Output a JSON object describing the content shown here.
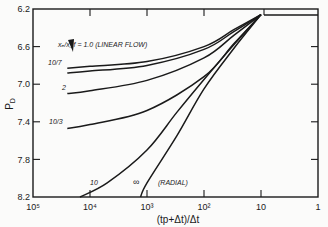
{
  "chart_data": {
    "type": "line",
    "title": "",
    "xlabel": "(tp+Δt)/Δt",
    "ylabel": "PD",
    "x_scale": "log",
    "x_reversed": true,
    "xlim": [
      100000,
      1
    ],
    "ylim": [
      8.2,
      6.2
    ],
    "y_reversed": true,
    "x_ticks": [
      "10^5",
      "10^4",
      "10^3",
      "10^2",
      "10",
      "1"
    ],
    "x_tick_labels": [
      "10⁵",
      "10⁴",
      "10³",
      "10²",
      "10",
      "1"
    ],
    "y_ticks": [
      "6.2",
      "6.6",
      "7.0",
      "7.4",
      "7.8",
      "8.2"
    ],
    "grid": false,
    "legend": "none (curves labeled inline)",
    "series": [
      {
        "name": "xe/xf = 1.0 (LINEAR FLOW)",
        "label": "xe/xf = 1.0 (LINEAR FLOW)",
        "x": [
          25000,
          10000,
          1000,
          100,
          30,
          10,
          1
        ],
        "y": [
          6.83,
          6.81,
          6.76,
          6.6,
          6.42,
          6.26,
          6.26
        ]
      },
      {
        "name": "10/7",
        "label": "10/7",
        "x": [
          25000,
          10000,
          1000,
          100,
          30,
          10,
          1
        ],
        "y": [
          6.88,
          6.86,
          6.8,
          6.63,
          6.44,
          6.26,
          6.26
        ]
      },
      {
        "name": "2",
        "label": "2",
        "x": [
          25000,
          10000,
          1000,
          100,
          30,
          10,
          1
        ],
        "y": [
          7.1,
          7.07,
          6.96,
          6.72,
          6.48,
          6.26,
          6.26
        ]
      },
      {
        "name": "10/3",
        "label": "10/3",
        "x": [
          25000,
          10000,
          1000,
          100,
          30,
          10,
          1
        ],
        "y": [
          7.47,
          7.43,
          7.28,
          6.92,
          6.57,
          6.26,
          6.26
        ]
      },
      {
        "name": "10",
        "label": "10",
        "x": [
          15000,
          5000,
          1000,
          300,
          100,
          30,
          10,
          1
        ],
        "y": [
          8.2,
          8.05,
          7.7,
          7.3,
          6.95,
          6.58,
          6.26,
          6.26
        ]
      },
      {
        "name": "∞ (RADIAL)",
        "label": "∞ (RADIAL)",
        "x": [
          1300,
          1000,
          300,
          100,
          30,
          10,
          1
        ],
        "y": [
          8.2,
          8.05,
          7.55,
          7.05,
          6.62,
          6.26,
          6.26
        ]
      }
    ]
  },
  "axes": {
    "y_label": "P",
    "y_label_sub": "D",
    "x_label": "(tp+Δt)/Δt",
    "x_tick_labels": [
      "10⁵",
      "10⁴",
      "10³",
      "10²",
      "10",
      "1"
    ],
    "y_tick_labels": [
      "6.2",
      "6.6",
      "7.0",
      "7.4",
      "7.8",
      "8.2"
    ]
  },
  "annotations": {
    "linear": "xₑ/x_f = 1.0 (LINEAR FLOW)",
    "c107": "10/7",
    "c2": "2",
    "c103": "10/3",
    "c10": "10",
    "cinf": "∞",
    "radial": "(RADIAL)"
  }
}
